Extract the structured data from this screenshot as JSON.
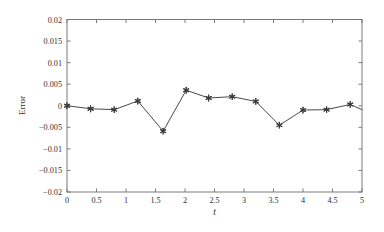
{
  "chart_data": {
    "type": "line",
    "title": "",
    "subtitle": "",
    "xlabel": "t",
    "ylabel": "Error",
    "xlim": [
      0,
      5
    ],
    "ylim": [
      -0.02,
      0.02
    ],
    "grid": false,
    "legend": null,
    "legend_position": "none",
    "marker": "star",
    "line_color": "#4a4a4a",
    "marker_color": "#3a3a3a",
    "axis_color": "#6d6d6d",
    "background_color": "#ffffff",
    "x": [
      0,
      0.4,
      0.8,
      1.2,
      1.63,
      2.02,
      2.4,
      2.8,
      3.2,
      3.6,
      4.0,
      4.4,
      4.8,
      5.0
    ],
    "y": [
      0.0,
      -0.0007,
      -0.0009,
      0.0011,
      -0.0059,
      0.0036,
      0.0018,
      0.0021,
      0.001,
      -0.0045,
      -0.001,
      -0.0009,
      0.0003,
      -0.0009
    ],
    "series": [
      {
        "name": "Error",
        "x": [
          0,
          0.4,
          0.8,
          1.2,
          1.63,
          2.02,
          2.4,
          2.8,
          3.2,
          3.6,
          4.0,
          4.4,
          4.8,
          5.0
        ],
        "values": [
          0.0,
          -0.0007,
          -0.0009,
          0.0011,
          -0.0059,
          0.0036,
          0.0018,
          0.0021,
          0.001,
          -0.0045,
          -0.001,
          -0.0009,
          0.0003,
          -0.0009
        ]
      }
    ],
    "xticks": [
      0,
      0.5,
      1,
      1.5,
      2,
      2.5,
      3,
      3.5,
      4,
      4.5,
      5
    ],
    "xtick_labels": [
      "0",
      "0.5",
      "1",
      "1.5",
      "2",
      "2.5",
      "3",
      "3.5",
      "4",
      "4.5",
      "5"
    ],
    "yticks": [
      0.02,
      0.015,
      0.01,
      0.005,
      0,
      -0.005,
      -0.01,
      -0.015,
      -0.02
    ],
    "ytick_labels": [
      "0.02",
      "0.015",
      "0.01",
      "0.005",
      "0",
      "−0.005",
      "−0.01",
      "−0.015",
      "−0.02"
    ],
    "annotations": []
  }
}
